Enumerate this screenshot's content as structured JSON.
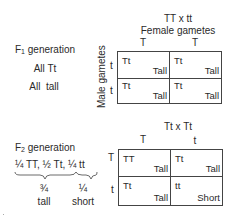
{
  "f1": {
    "cross": "TT x tt",
    "female_gametes_label": "Female gametes",
    "male_gametes_label": "Male gametes",
    "column_gametes": [
      "T",
      "T"
    ],
    "row_gametes": [
      "t",
      "t"
    ],
    "cells": [
      [
        {
          "genotype": "Tt",
          "phenotype": "Tall"
        },
        {
          "genotype": "Tt",
          "phenotype": "Tall"
        }
      ],
      [
        {
          "genotype": "Tt",
          "phenotype": "Tall"
        },
        {
          "genotype": "Tt",
          "phenotype": "Tall"
        }
      ]
    ],
    "generation_prefix": "F",
    "generation_sub": "1",
    "generation_suffix": " generation",
    "summary_genotype": "All Tt",
    "summary_phenotype": "All  tall"
  },
  "f2": {
    "cross": "Tt x Tt",
    "column_gametes": [
      "T",
      "t"
    ],
    "row_gametes": [
      "T",
      "t"
    ],
    "cells": [
      [
        {
          "genotype": "TT",
          "phenotype": "Tall"
        },
        {
          "genotype": "Tt",
          "phenotype": "Tall"
        }
      ],
      [
        {
          "genotype": "Tt",
          "phenotype": "Tall"
        },
        {
          "genotype": "tt",
          "phenotype": "Short"
        }
      ]
    ],
    "generation_prefix": "F",
    "generation_sub": "2",
    "generation_suffix": " generation",
    "ratio_line": "¼ TT, ½ Tt, ¼ tt",
    "tall_fraction": "¾",
    "tall_label": "tall",
    "short_fraction": "¼",
    "short_label": "short"
  },
  "colors": {
    "ink": "#2a2a2a",
    "grid_line": "#444444",
    "background": "#ffffff"
  }
}
